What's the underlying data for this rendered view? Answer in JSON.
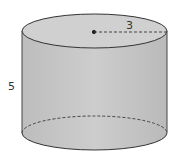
{
  "figure": {
    "shape": "cylinder",
    "radius_label": "3",
    "height_label": "5",
    "colors": {
      "fill": "#c8c8c8",
      "side_light": "#d6d6d6",
      "side_dark": "#b4b4b4",
      "stroke": "#333333"
    }
  }
}
